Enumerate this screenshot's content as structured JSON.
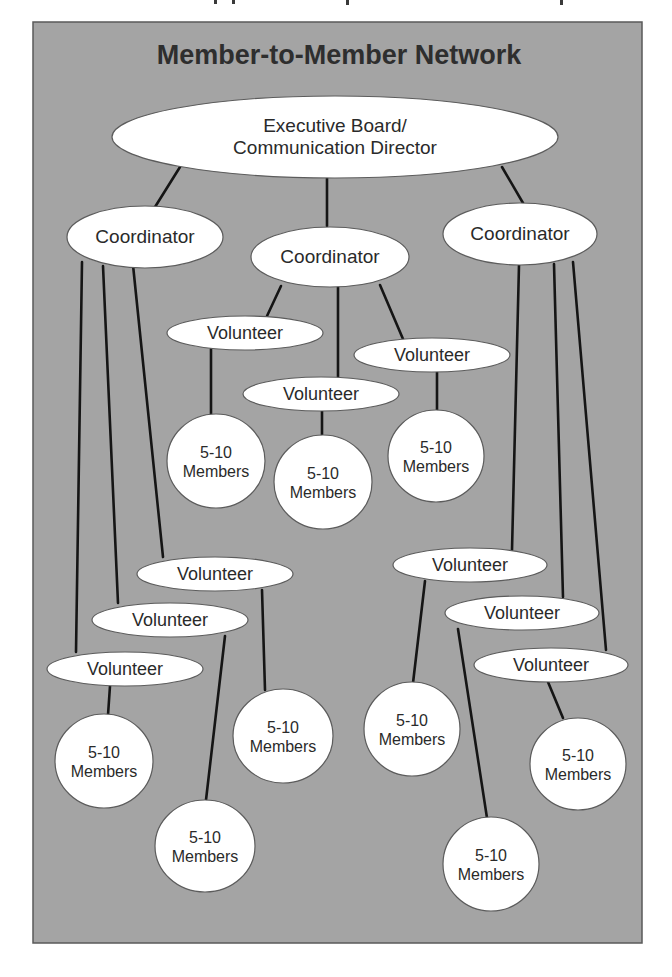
{
  "title": "Member-to-Member Network",
  "colors": {
    "panel_background": "#a4a4a4",
    "node_fill": "#ffffff",
    "connector": "#151515",
    "text": "#2a2a2a"
  },
  "nodes": {
    "exec": {
      "role": "executive",
      "lines": [
        "Executive Board/",
        "Communication Director"
      ]
    },
    "coord_left": {
      "role": "coordinator",
      "lines": [
        "Coordinator"
      ]
    },
    "coord_mid": {
      "role": "coordinator",
      "lines": [
        "Coordinator"
      ]
    },
    "coord_right": {
      "role": "coordinator",
      "lines": [
        "Coordinator"
      ]
    },
    "vol_m1": {
      "role": "volunteer",
      "lines": [
        "Volunteer"
      ]
    },
    "vol_m2": {
      "role": "volunteer",
      "lines": [
        "Volunteer"
      ]
    },
    "vol_m3": {
      "role": "volunteer",
      "lines": [
        "Volunteer"
      ]
    },
    "vol_l1": {
      "role": "volunteer",
      "lines": [
        "Volunteer"
      ]
    },
    "vol_l2": {
      "role": "volunteer",
      "lines": [
        "Volunteer"
      ]
    },
    "vol_l3": {
      "role": "volunteer",
      "lines": [
        "Volunteer"
      ]
    },
    "vol_r1": {
      "role": "volunteer",
      "lines": [
        "Volunteer"
      ]
    },
    "vol_r2": {
      "role": "volunteer",
      "lines": [
        "Volunteer"
      ]
    },
    "vol_r3": {
      "role": "volunteer",
      "lines": [
        "Volunteer"
      ]
    },
    "mem_m1": {
      "role": "members",
      "lines": [
        "5-10",
        "Members"
      ]
    },
    "mem_m2": {
      "role": "members",
      "lines": [
        "5-10",
        "Members"
      ]
    },
    "mem_m3": {
      "role": "members",
      "lines": [
        "5-10",
        "Members"
      ]
    },
    "mem_l1": {
      "role": "members",
      "lines": [
        "5-10",
        "Members"
      ]
    },
    "mem_l2": {
      "role": "members",
      "lines": [
        "5-10",
        "Members"
      ]
    },
    "mem_l3": {
      "role": "members",
      "lines": [
        "5-10",
        "Members"
      ]
    },
    "mem_r1": {
      "role": "members",
      "lines": [
        "5-10",
        "Members"
      ]
    },
    "mem_r2": {
      "role": "members",
      "lines": [
        "5-10",
        "Members"
      ]
    },
    "mem_r3": {
      "role": "members",
      "lines": [
        "5-10",
        "Members"
      ]
    }
  },
  "edges": [
    [
      "exec",
      "coord_left"
    ],
    [
      "exec",
      "coord_mid"
    ],
    [
      "exec",
      "coord_right"
    ],
    [
      "coord_mid",
      "vol_m1"
    ],
    [
      "coord_mid",
      "vol_m2"
    ],
    [
      "coord_mid",
      "vol_m3"
    ],
    [
      "vol_m1",
      "mem_m1"
    ],
    [
      "vol_m2",
      "mem_m2"
    ],
    [
      "vol_m3",
      "mem_m3"
    ],
    [
      "coord_left",
      "vol_l1"
    ],
    [
      "coord_left",
      "vol_l2"
    ],
    [
      "coord_left",
      "vol_l3"
    ],
    [
      "vol_l1",
      "mem_l1"
    ],
    [
      "vol_l2",
      "mem_l2"
    ],
    [
      "vol_l3",
      "mem_l3"
    ],
    [
      "coord_right",
      "vol_r1"
    ],
    [
      "coord_right",
      "vol_r2"
    ],
    [
      "coord_right",
      "vol_r3"
    ],
    [
      "vol_r1",
      "mem_r1"
    ],
    [
      "vol_r2",
      "mem_r2"
    ],
    [
      "vol_r3",
      "mem_r3"
    ]
  ]
}
